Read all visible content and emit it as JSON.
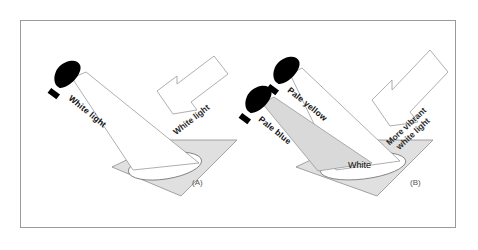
{
  "figure": {
    "background_color": "#ffffff",
    "border_color": "#9a9a9a",
    "ink_color": "#555555",
    "surface_fill": "#e0e0e0",
    "beam_fill": "#d9d9d9",
    "flashlight_color": "#000000"
  },
  "panels": [
    {
      "tag": "(A)",
      "tag_name": "panel-a-tag",
      "incident_label": "White light",
      "reflected_label": "More white light",
      "pool_label": ""
    },
    {
      "tag": "(B)",
      "tag_name": "panel-b-tag",
      "incident_label_1": "Pale yellow",
      "incident_label_2": "Pale blue",
      "reflected_label_line1": "More vibrant",
      "reflected_label_line2": "white light",
      "pool_label": "White"
    }
  ],
  "labels": {
    "a_incident": "White light",
    "a_reflected": "White light",
    "a_tag": "(A)",
    "b_incident_top": "Pale yellow",
    "b_incident_bottom": "Pale blue",
    "b_reflected_line1": "More vibrant",
    "b_reflected_line2": "white light",
    "b_pool": "White",
    "b_tag": "(B)"
  }
}
